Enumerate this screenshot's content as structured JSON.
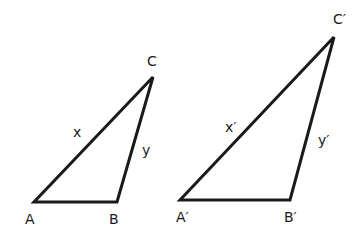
{
  "diagram": {
    "type": "similar-triangles",
    "stroke_color": "#1a1a1a",
    "triangles": [
      {
        "id": "original",
        "vertices": [
          {
            "label": "A",
            "x": 34,
            "y": 202,
            "lx": 25,
            "ly": 224
          },
          {
            "label": "B",
            "x": 117,
            "y": 202,
            "lx": 109,
            "ly": 224
          },
          {
            "label": "C",
            "x": 153,
            "y": 77,
            "lx": 147,
            "ly": 66
          }
        ],
        "sides": [
          {
            "label": "x",
            "lx": 73,
            "ly": 137
          },
          {
            "label": "y",
            "lx": 142,
            "ly": 155
          }
        ]
      },
      {
        "id": "similar",
        "vertices": [
          {
            "label": "A′",
            "x": 180,
            "y": 200,
            "lx": 176,
            "ly": 222
          },
          {
            "label": "B′",
            "x": 290,
            "y": 200,
            "lx": 284,
            "ly": 222
          },
          {
            "label": "C′",
            "x": 334,
            "y": 37,
            "lx": 333,
            "ly": 24
          }
        ],
        "sides": [
          {
            "label": "x′",
            "lx": 225,
            "ly": 132
          },
          {
            "label": "y′",
            "lx": 318,
            "ly": 145
          }
        ]
      }
    ]
  }
}
